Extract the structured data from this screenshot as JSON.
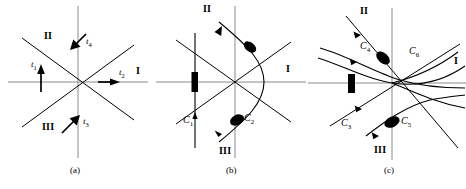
{
  "figure": {
    "title": "",
    "panels": [
      {
        "id": "a",
        "caption": "(a)",
        "sector_labels": [
          {
            "name": "I",
            "text": "I"
          },
          {
            "name": "II",
            "text": "II"
          },
          {
            "name": "III",
            "text": "III"
          }
        ],
        "trajectory_labels": [
          {
            "name": "t1",
            "base": "t",
            "sub": "1"
          },
          {
            "name": "t2",
            "base": "t",
            "sub": "2"
          },
          {
            "name": "t3",
            "base": "t",
            "sub": "3"
          },
          {
            "name": "t4",
            "base": "t",
            "sub": "4"
          }
        ]
      },
      {
        "id": "b",
        "caption": "(b)",
        "sector_labels": [
          {
            "name": "I",
            "text": "I"
          },
          {
            "name": "II",
            "text": "II"
          },
          {
            "name": "III",
            "text": "III"
          }
        ],
        "curve_labels": [
          {
            "name": "C1",
            "base": "C",
            "sub": "1"
          },
          {
            "name": "C2",
            "base": "C",
            "sub": "2"
          }
        ]
      },
      {
        "id": "c",
        "caption": "(c)",
        "sector_labels": [
          {
            "name": "I",
            "text": "I"
          },
          {
            "name": "II",
            "text": "II"
          },
          {
            "name": "III",
            "text": "III"
          }
        ],
        "curve_labels": [
          {
            "name": "C3",
            "base": "C",
            "sub": "3"
          },
          {
            "name": "C4",
            "base": "C",
            "sub": "4"
          },
          {
            "name": "C5",
            "base": "C",
            "sub": "5"
          },
          {
            "name": "C6",
            "base": "C",
            "sub": "6"
          }
        ]
      }
    ],
    "colors": {
      "axis": "#8a8a8a",
      "curve": "#000000",
      "background": "#ffffff"
    }
  },
  "panel_a": {
    "sector_I": "I",
    "sector_II": "II",
    "sector_III": "III",
    "t1": "t",
    "t1_sub": "1",
    "t2": "t",
    "t2_sub": "2",
    "t3": "t",
    "t3_sub": "3",
    "t4": "t",
    "t4_sub": "4",
    "caption": "(a)"
  },
  "panel_b": {
    "sector_I": "I",
    "sector_II": "II",
    "sector_III": "III",
    "C1": "C",
    "C1_sub": "1",
    "C2": "C",
    "C2_sub": "2",
    "caption": "(b)"
  },
  "panel_c": {
    "sector_I": "I",
    "sector_II": "II",
    "sector_III": "III",
    "C3": "C",
    "C3_sub": "3",
    "C4": "C",
    "C4_sub": "4",
    "C5": "C",
    "C5_sub": "5",
    "C6": "C",
    "C6_sub": "6",
    "caption": "(c)"
  }
}
